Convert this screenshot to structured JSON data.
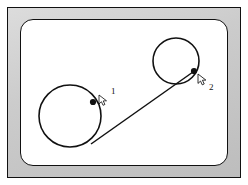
{
  "figure": {
    "frame": {
      "bezel_color": "#c9c9c9",
      "outline_color": "#111111",
      "screen_color": "#ffffff"
    }
  },
  "diagram": {
    "type": "schematic",
    "stroke_color": "#111111",
    "shapes": [
      {
        "name": "circle-left",
        "kind": "circle",
        "cx": 49,
        "cy": 96,
        "r": 31,
        "stroke_width": 1.6
      },
      {
        "name": "circle-right",
        "kind": "circle",
        "cx": 155,
        "cy": 41,
        "r": 23,
        "stroke_width": 1.6
      },
      {
        "name": "connector-line",
        "kind": "line",
        "x1": 70,
        "y1": 124,
        "x2": 172,
        "y2": 52,
        "stroke_width": 1.5
      }
    ],
    "nodes": [
      {
        "name": "node-point-1",
        "label": "1",
        "cx": 72,
        "cy": 82,
        "r": 3.1,
        "cursor_x": 78,
        "cursor_y": 76,
        "label_x": 90,
        "label_y": 74
      },
      {
        "name": "node-point-2",
        "label": "2",
        "cx": 173,
        "cy": 51,
        "r": 3.1,
        "cursor_x": 178,
        "cursor_y": 55,
        "label_x": 189,
        "label_y": 69
      }
    ]
  },
  "labels": {
    "marker_one": "1",
    "marker_two": "2"
  }
}
